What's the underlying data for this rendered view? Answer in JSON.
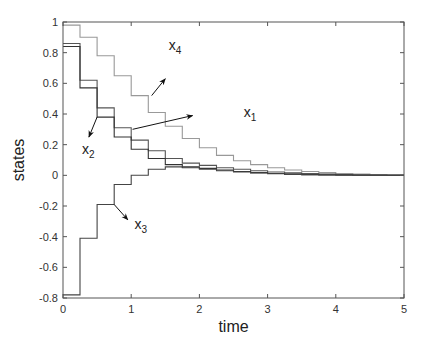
{
  "chart_data": {
    "type": "line",
    "subtype": "step",
    "title": "",
    "xlabel": "time",
    "ylabel": "states",
    "xlim": [
      0,
      5
    ],
    "ylim": [
      -0.8,
      1
    ],
    "xticks": [
      0,
      1,
      2,
      3,
      4,
      5
    ],
    "yticks": [
      -0.8,
      -0.6,
      -0.4,
      -0.2,
      0,
      0.2,
      0.4,
      0.6,
      0.8,
      1
    ],
    "xtick_labels": [
      "0",
      "1",
      "2",
      "3",
      "4",
      "5"
    ],
    "ytick_labels": [
      "-0.8",
      "-0.6",
      "-0.4",
      "-0.2",
      "0",
      "0.2",
      "0.4",
      "0.6",
      "0.8",
      "1"
    ],
    "grid": false,
    "legend": "none (inline arrow annotations)",
    "step_size": 0.25,
    "x": [
      0,
      0.25,
      0.5,
      0.75,
      1.0,
      1.25,
      1.5,
      1.75,
      2.0,
      2.25,
      2.5,
      2.75,
      3.0,
      3.25,
      3.5,
      3.75,
      4.0,
      4.25,
      4.5,
      4.75,
      5.0
    ],
    "series": [
      {
        "name": "x1",
        "color": "#555555",
        "values": [
          0.86,
          0.62,
          0.44,
          0.31,
          0.23,
          0.16,
          0.11,
          0.08,
          0.065,
          0.05,
          0.04,
          0.03,
          0.022,
          0.016,
          0.011,
          0.008,
          0.005,
          0.003,
          0.002,
          0.001,
          0.0
        ]
      },
      {
        "name": "x2",
        "color": "#333333",
        "values": [
          0.84,
          0.57,
          0.38,
          0.25,
          0.17,
          0.11,
          0.07,
          0.055,
          0.045,
          0.035,
          0.025,
          0.018,
          0.012,
          0.008,
          0.005,
          0.003,
          0.002,
          0.001,
          0.0,
          0.0,
          0.0
        ]
      },
      {
        "name": "x3",
        "color": "#444444",
        "values": [
          -0.78,
          -0.41,
          -0.19,
          -0.06,
          0.0,
          0.04,
          0.055,
          0.05,
          0.04,
          0.03,
          0.022,
          0.015,
          0.01,
          0.006,
          0.004,
          0.002,
          0.001,
          0.0,
          0.0,
          0.0,
          0.0
        ]
      },
      {
        "name": "x4",
        "color": "#999999",
        "values": [
          0.98,
          0.9,
          0.78,
          0.65,
          0.52,
          0.41,
          0.32,
          0.24,
          0.18,
          0.13,
          0.095,
          0.07,
          0.05,
          0.035,
          0.025,
          0.018,
          0.012,
          0.008,
          0.005,
          0.003,
          0.0
        ]
      }
    ],
    "annotations": [
      {
        "label": "x",
        "sub": "4",
        "text_pos": [
          1.55,
          0.82
        ],
        "arrow_from": [
          1.3,
          0.52
        ],
        "arrow_to": [
          1.5,
          0.63
        ]
      },
      {
        "label": "x",
        "sub": "1",
        "text_pos": [
          2.65,
          0.38
        ],
        "arrow_from": [
          1.02,
          0.3
        ],
        "arrow_to": [
          1.9,
          0.39
        ]
      },
      {
        "label": "x",
        "sub": "2",
        "text_pos": [
          0.28,
          0.14
        ],
        "arrow_from": [
          0.5,
          0.38
        ],
        "arrow_to": [
          0.38,
          0.25
        ]
      },
      {
        "label": "x",
        "sub": "3",
        "text_pos": [
          1.05,
          -0.35
        ],
        "arrow_from": [
          0.75,
          -0.19
        ],
        "arrow_to": [
          0.95,
          -0.29
        ]
      }
    ]
  },
  "layout": {
    "plot_left": 63,
    "plot_top": 22,
    "plot_right": 404,
    "plot_bottom": 298
  }
}
